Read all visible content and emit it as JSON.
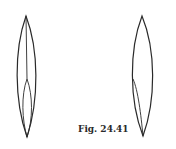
{
  "figure": {
    "caption": "Fig. 24.41",
    "stroke_color": "#2a2a2a",
    "shapes": [
      {
        "name": "left-lens",
        "description": "Elongated biconvex lens shape with a central vertical line from the top tip that splits into an inner lens toward the bottom tip"
      },
      {
        "name": "right-lens",
        "description": "Elongated biconvex lens shape with an inner curve from the left edge mid-height to the bottom tip"
      }
    ]
  }
}
